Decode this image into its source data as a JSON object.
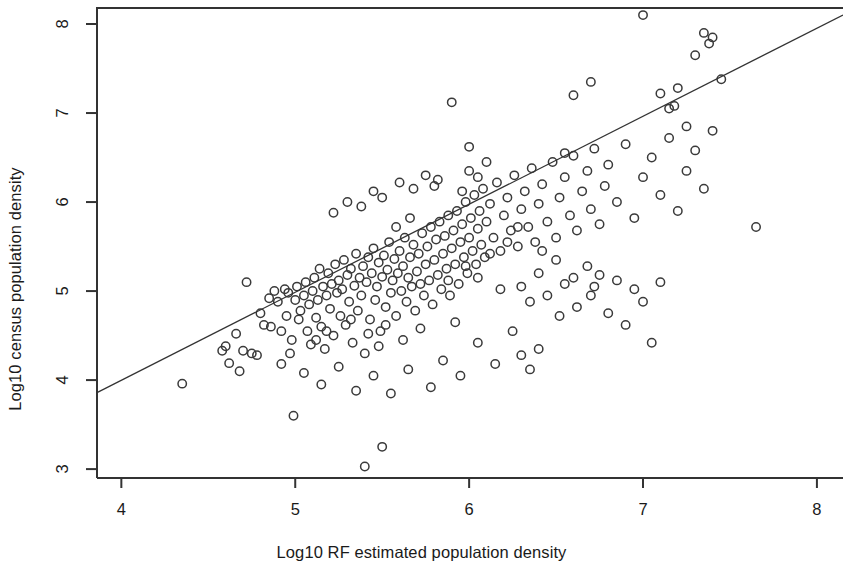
{
  "chart_data": {
    "type": "scatter",
    "title": "",
    "xlabel": "Log10 RF estimated population density",
    "ylabel": "Log10 census population density",
    "xlim": [
      3.86,
      8.15
    ],
    "ylim": [
      2.9,
      8.18
    ],
    "xticks": [
      4,
      5,
      6,
      7,
      8
    ],
    "yticks": [
      3,
      4,
      5,
      6,
      7,
      8
    ],
    "xtick_labels": [
      "4",
      "5",
      "6",
      "7",
      "8"
    ],
    "ytick_labels": [
      "3",
      "4",
      "5",
      "6",
      "7",
      "8"
    ],
    "grid": false,
    "legend": null,
    "marker": {
      "shape": "open-circle",
      "radius": 4.2,
      "stroke": "#3a3a3a",
      "stroke_width": 1.5,
      "fill": "none"
    },
    "fit_line": {
      "type": "linear-regression",
      "color": "#333333",
      "width": 1.3,
      "x_start": 3.86,
      "y_start": 3.86,
      "x_end": 8.15,
      "y_end": 8.1
    },
    "series": [
      {
        "name": "localities",
        "points": [
          [
            4.35,
            3.96
          ],
          [
            4.58,
            4.33
          ],
          [
            4.6,
            4.38
          ],
          [
            4.62,
            4.19
          ],
          [
            4.66,
            4.52
          ],
          [
            4.7,
            4.33
          ],
          [
            4.72,
            5.1
          ],
          [
            4.75,
            4.3
          ],
          [
            4.78,
            4.28
          ],
          [
            4.8,
            4.75
          ],
          [
            4.82,
            4.62
          ],
          [
            4.85,
            4.92
          ],
          [
            4.86,
            4.6
          ],
          [
            4.88,
            5.0
          ],
          [
            4.9,
            4.88
          ],
          [
            4.92,
            4.55
          ],
          [
            4.94,
            5.02
          ],
          [
            4.95,
            4.72
          ],
          [
            4.96,
            4.98
          ],
          [
            4.97,
            4.3
          ],
          [
            4.98,
            4.45
          ],
          [
            4.99,
            3.6
          ],
          [
            5.0,
            4.9
          ],
          [
            5.01,
            5.05
          ],
          [
            5.02,
            4.68
          ],
          [
            5.03,
            4.78
          ],
          [
            5.05,
            4.95
          ],
          [
            5.06,
            5.1
          ],
          [
            5.07,
            4.55
          ],
          [
            5.08,
            4.85
          ],
          [
            5.09,
            4.4
          ],
          [
            5.1,
            5.0
          ],
          [
            5.11,
            5.15
          ],
          [
            5.12,
            4.7
          ],
          [
            5.13,
            4.9
          ],
          [
            5.14,
            5.25
          ],
          [
            5.15,
            4.6
          ],
          [
            5.16,
            5.05
          ],
          [
            5.17,
            4.35
          ],
          [
            5.18,
            4.95
          ],
          [
            5.19,
            5.2
          ],
          [
            5.2,
            4.8
          ],
          [
            5.21,
            5.08
          ],
          [
            5.22,
            4.5
          ],
          [
            5.23,
            5.3
          ],
          [
            5.24,
            4.98
          ],
          [
            5.25,
            5.12
          ],
          [
            5.26,
            4.72
          ],
          [
            5.27,
            5.02
          ],
          [
            5.28,
            5.35
          ],
          [
            5.29,
            4.62
          ],
          [
            5.3,
            5.18
          ],
          [
            5.31,
            4.88
          ],
          [
            5.32,
            5.25
          ],
          [
            5.33,
            4.42
          ],
          [
            5.34,
            5.06
          ],
          [
            5.35,
            5.42
          ],
          [
            5.36,
            4.78
          ],
          [
            5.37,
            5.15
          ],
          [
            5.38,
            4.95
          ],
          [
            5.39,
            5.28
          ],
          [
            5.4,
            3.03
          ],
          [
            5.4,
            4.3
          ],
          [
            5.41,
            5.1
          ],
          [
            5.42,
            5.38
          ],
          [
            5.43,
            4.68
          ],
          [
            5.44,
            5.2
          ],
          [
            5.45,
            5.48
          ],
          [
            5.46,
            4.9
          ],
          [
            5.47,
            5.05
          ],
          [
            5.48,
            5.32
          ],
          [
            5.49,
            4.55
          ],
          [
            5.5,
            5.16
          ],
          [
            5.5,
            3.25
          ],
          [
            5.51,
            5.4
          ],
          [
            5.52,
            4.82
          ],
          [
            5.53,
            5.24
          ],
          [
            5.54,
            5.55
          ],
          [
            5.55,
            4.98
          ],
          [
            5.56,
            5.12
          ],
          [
            5.57,
            5.36
          ],
          [
            5.58,
            4.72
          ],
          [
            5.59,
            5.2
          ],
          [
            5.6,
            5.45
          ],
          [
            5.61,
            5.0
          ],
          [
            5.62,
            5.28
          ],
          [
            5.63,
            5.6
          ],
          [
            5.64,
            4.88
          ],
          [
            5.65,
            5.15
          ],
          [
            5.66,
            5.38
          ],
          [
            5.67,
            5.05
          ],
          [
            5.68,
            5.52
          ],
          [
            5.69,
            4.78
          ],
          [
            5.7,
            5.22
          ],
          [
            5.71,
            5.42
          ],
          [
            5.72,
            5.08
          ],
          [
            5.73,
            5.65
          ],
          [
            5.74,
            4.95
          ],
          [
            5.75,
            5.3
          ],
          [
            5.76,
            5.5
          ],
          [
            5.77,
            5.12
          ],
          [
            5.78,
            5.72
          ],
          [
            5.79,
            4.85
          ],
          [
            5.8,
            5.35
          ],
          [
            5.81,
            5.58
          ],
          [
            5.82,
            5.18
          ],
          [
            5.83,
            5.78
          ],
          [
            5.84,
            5.02
          ],
          [
            5.85,
            5.42
          ],
          [
            5.86,
            5.62
          ],
          [
            5.87,
            5.25
          ],
          [
            5.88,
            5.85
          ],
          [
            5.89,
            4.95
          ],
          [
            5.9,
            5.48
          ],
          [
            5.91,
            5.68
          ],
          [
            5.92,
            5.3
          ],
          [
            5.93,
            5.9
          ],
          [
            5.94,
            5.08
          ],
          [
            5.95,
            5.55
          ],
          [
            5.96,
            5.75
          ],
          [
            5.97,
            5.38
          ],
          [
            5.98,
            6.0
          ],
          [
            5.99,
            5.2
          ],
          [
            6.0,
            5.6
          ],
          [
            6.01,
            5.82
          ],
          [
            6.02,
            5.45
          ],
          [
            6.03,
            6.08
          ],
          [
            6.04,
            5.3
          ],
          [
            6.05,
            5.7
          ],
          [
            6.06,
            5.9
          ],
          [
            6.07,
            5.52
          ],
          [
            6.08,
            6.15
          ],
          [
            6.09,
            5.38
          ],
          [
            6.1,
            5.78
          ],
          [
            6.12,
            5.98
          ],
          [
            6.14,
            5.6
          ],
          [
            6.16,
            6.22
          ],
          [
            6.18,
            5.45
          ],
          [
            6.2,
            5.85
          ],
          [
            6.22,
            6.05
          ],
          [
            6.24,
            5.68
          ],
          [
            6.26,
            6.3
          ],
          [
            6.28,
            5.5
          ],
          [
            6.3,
            5.92
          ],
          [
            6.32,
            6.12
          ],
          [
            6.34,
            5.72
          ],
          [
            6.36,
            6.38
          ],
          [
            6.38,
            5.55
          ],
          [
            6.4,
            5.98
          ],
          [
            6.42,
            6.2
          ],
          [
            6.45,
            5.78
          ],
          [
            6.48,
            6.45
          ],
          [
            6.5,
            5.6
          ],
          [
            6.52,
            6.05
          ],
          [
            6.55,
            6.28
          ],
          [
            6.58,
            5.85
          ],
          [
            6.6,
            6.52
          ],
          [
            6.62,
            5.68
          ],
          [
            6.65,
            6.12
          ],
          [
            6.68,
            6.35
          ],
          [
            6.7,
            5.92
          ],
          [
            6.72,
            6.6
          ],
          [
            6.75,
            5.75
          ],
          [
            6.78,
            6.18
          ],
          [
            6.8,
            6.42
          ],
          [
            6.85,
            6.0
          ],
          [
            6.9,
            6.65
          ],
          [
            6.95,
            5.82
          ],
          [
            7.0,
            6.28
          ],
          [
            7.05,
            6.5
          ],
          [
            7.1,
            6.08
          ],
          [
            7.15,
            6.72
          ],
          [
            7.2,
            5.9
          ],
          [
            7.25,
            6.35
          ],
          [
            7.3,
            6.58
          ],
          [
            7.35,
            6.15
          ],
          [
            7.4,
            6.8
          ],
          [
            5.9,
            7.12
          ],
          [
            6.0,
            6.62
          ],
          [
            6.0,
            6.35
          ],
          [
            6.55,
            6.55
          ],
          [
            6.6,
            7.2
          ],
          [
            6.7,
            7.35
          ],
          [
            7.0,
            8.1
          ],
          [
            7.1,
            7.22
          ],
          [
            7.15,
            7.05
          ],
          [
            7.18,
            7.08
          ],
          [
            7.2,
            7.28
          ],
          [
            7.25,
            6.85
          ],
          [
            7.3,
            7.65
          ],
          [
            7.35,
            7.9
          ],
          [
            7.38,
            7.78
          ],
          [
            7.4,
            7.85
          ],
          [
            7.45,
            7.38
          ],
          [
            5.8,
            6.18
          ],
          [
            5.82,
            6.25
          ],
          [
            5.75,
            6.3
          ],
          [
            5.68,
            6.15
          ],
          [
            5.6,
            6.22
          ],
          [
            5.5,
            6.05
          ],
          [
            5.45,
            6.12
          ],
          [
            5.38,
            5.95
          ],
          [
            5.3,
            6.0
          ],
          [
            5.22,
            5.88
          ],
          [
            6.3,
            5.05
          ],
          [
            6.35,
            4.88
          ],
          [
            6.4,
            5.2
          ],
          [
            6.45,
            4.95
          ],
          [
            6.5,
            5.35
          ],
          [
            6.52,
            4.72
          ],
          [
            6.55,
            5.08
          ],
          [
            6.6,
            5.15
          ],
          [
            6.62,
            4.82
          ],
          [
            6.68,
            5.28
          ],
          [
            6.7,
            4.95
          ],
          [
            6.72,
            5.05
          ],
          [
            6.75,
            5.18
          ],
          [
            6.8,
            4.75
          ],
          [
            6.85,
            5.12
          ],
          [
            6.9,
            4.62
          ],
          [
            6.95,
            5.02
          ],
          [
            7.0,
            4.88
          ],
          [
            7.05,
            4.42
          ],
          [
            7.1,
            5.1
          ],
          [
            6.25,
            4.55
          ],
          [
            6.3,
            4.28
          ],
          [
            6.35,
            4.12
          ],
          [
            6.4,
            4.35
          ],
          [
            6.15,
            4.18
          ],
          [
            6.05,
            4.42
          ],
          [
            5.95,
            4.05
          ],
          [
            5.85,
            4.22
          ],
          [
            5.78,
            3.92
          ],
          [
            5.65,
            4.12
          ],
          [
            5.55,
            3.85
          ],
          [
            5.45,
            4.05
          ],
          [
            5.35,
            3.88
          ],
          [
            5.25,
            4.15
          ],
          [
            5.15,
            3.95
          ],
          [
            5.05,
            4.08
          ],
          [
            7.65,
            5.72
          ],
          [
            6.1,
            6.45
          ],
          [
            6.18,
            5.02
          ],
          [
            5.92,
            4.65
          ],
          [
            5.48,
            4.38
          ],
          [
            5.18,
            4.55
          ],
          [
            4.68,
            4.1
          ],
          [
            6.05,
            5.15
          ],
          [
            6.12,
            5.42
          ],
          [
            5.98,
            5.28
          ],
          [
            5.88,
            5.12
          ],
          [
            5.72,
            4.58
          ],
          [
            5.62,
            4.45
          ],
          [
            5.52,
            4.62
          ],
          [
            5.42,
            4.52
          ],
          [
            5.32,
            4.68
          ],
          [
            5.12,
            4.45
          ],
          [
            4.92,
            4.18
          ],
          [
            5.58,
            5.72
          ],
          [
            5.66,
            5.82
          ],
          [
            6.22,
            5.55
          ],
          [
            6.28,
            5.72
          ],
          [
            6.42,
            5.45
          ],
          [
            6.05,
            6.28
          ],
          [
            5.96,
            6.12
          ]
        ]
      }
    ]
  }
}
